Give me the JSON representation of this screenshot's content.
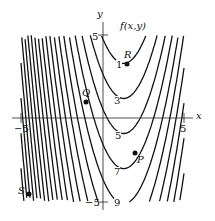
{
  "chart_data": {
    "type": "contour",
    "title": "f(x,y)",
    "xlabel": "x",
    "ylabel": "y",
    "xlim": [
      -5,
      5
    ],
    "ylim": [
      -5,
      5
    ],
    "x_ticks": [
      "-5",
      "5"
    ],
    "y_ticks": [
      "5",
      "-5"
    ],
    "contour_levels": [
      "1",
      "3",
      "5",
      "7",
      "9"
    ],
    "grid": false,
    "points": [
      {
        "name": "R",
        "x": 1.5,
        "y": 3.2
      },
      {
        "name": "Q",
        "x": -1.0,
        "y": 1.0
      },
      {
        "name": "P",
        "x": 2.0,
        "y": -2.1
      },
      {
        "name": "S",
        "x": -4.5,
        "y": -4.5
      }
    ],
    "colors": {
      "line": "#111111",
      "axis": "#222222",
      "background": "#ffffff"
    }
  },
  "labels": {
    "title": "f(x,y)",
    "x_axis": "x",
    "y_axis": "y",
    "x_min": "−5",
    "x_max": "5",
    "y_max": "5",
    "y_min": "−5",
    "lvl1": "1",
    "lvl3": "3",
    "lvl5": "5",
    "lvl7": "7",
    "lvl9": "9",
    "R": "R",
    "Q": "Q",
    "P": "P",
    "S": "S"
  }
}
